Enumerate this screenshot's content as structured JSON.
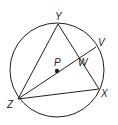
{
  "diagram": {
    "colors": {
      "stroke": "#231f20",
      "background": "#ffffff"
    },
    "circle": {
      "name": "P",
      "cx": 57,
      "cy": 70,
      "r": 47
    },
    "points": [
      {
        "label": "Y",
        "x": 58,
        "y": 24,
        "lx": 55,
        "ly": 20
      },
      {
        "label": "Z",
        "x": 18,
        "y": 99,
        "lx": 7,
        "ly": 108
      },
      {
        "label": "X",
        "x": 99,
        "y": 89,
        "lx": 101,
        "ly": 97
      },
      {
        "label": "V",
        "x": 96,
        "y": 47,
        "lx": 98,
        "ly": 46
      },
      {
        "label": "P",
        "x": 57,
        "y": 71,
        "lx": 54,
        "ly": 66
      },
      {
        "label": "W",
        "x": 80,
        "y": 57,
        "lx": 78,
        "ly": 66
      }
    ],
    "segments": [
      "ZY",
      "YX",
      "XZ",
      "ZV"
    ]
  }
}
